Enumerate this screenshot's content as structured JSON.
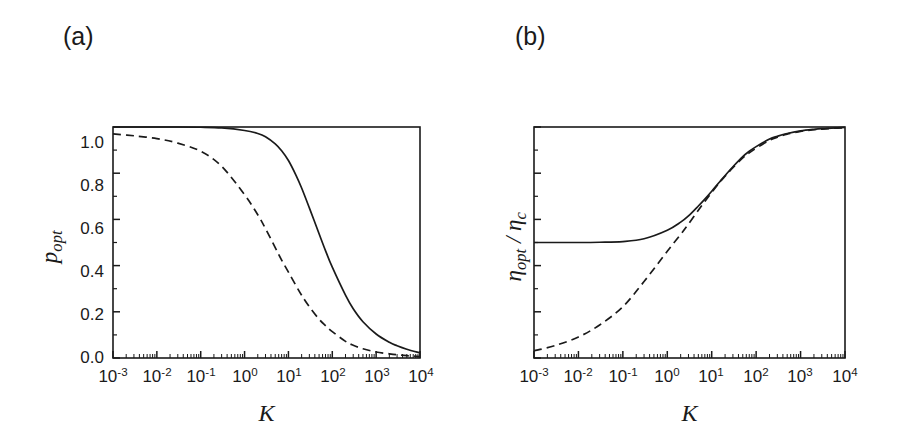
{
  "figure": {
    "background": "#ffffff",
    "line_color": "#1a1a1a"
  },
  "panels": [
    {
      "tag": "(a)",
      "ylabel_main": "p",
      "ylabel_sub": "opt",
      "xlabel": "K"
    },
    {
      "tag": "(b)",
      "ylabel_main": "η",
      "ylabel_sub": "opt",
      "ylabel_sep": " / ",
      "ylabel_main2": "η",
      "ylabel_sub2": "c",
      "xlabel": "K"
    }
  ],
  "axes": {
    "y_ticks": [
      "0.0",
      "0.2",
      "0.4",
      "0.6",
      "0.8",
      "1.0"
    ],
    "y_tick_values": [
      0.0,
      0.2,
      0.4,
      0.6,
      0.8,
      1.0
    ],
    "x_tick_mantissa": "10",
    "x_tick_exponents": [
      "-3",
      "-2",
      "-1",
      "0",
      "1",
      "2",
      "3",
      "4"
    ],
    "x_tick_values": [
      0.001,
      0.01,
      0.1,
      1,
      10,
      100,
      1000,
      10000
    ]
  },
  "chart_data": [
    {
      "type": "line",
      "title": "(a)",
      "xlabel": "K",
      "ylabel": "p_opt",
      "xscale": "log",
      "xlim": [
        0.001,
        10000
      ],
      "ylim": [
        0.0,
        1.0
      ],
      "grid": false,
      "legend": "none",
      "x": [
        0.001,
        0.003,
        0.01,
        0.03,
        0.1,
        0.3,
        1,
        2,
        3,
        5,
        7,
        10,
        15,
        20,
        30,
        50,
        70,
        100,
        200,
        300,
        500,
        1000,
        2000,
        3000,
        5000,
        10000
      ],
      "series": [
        {
          "name": "solid",
          "style": "solid",
          "values": [
            1.0,
            1.0,
            1.0,
            1.0,
            0.999,
            0.996,
            0.985,
            0.972,
            0.958,
            0.927,
            0.897,
            0.855,
            0.79,
            0.736,
            0.65,
            0.538,
            0.465,
            0.393,
            0.272,
            0.213,
            0.157,
            0.104,
            0.068,
            0.053,
            0.038,
            0.022
          ]
        },
        {
          "name": "dashed",
          "style": "dashed",
          "values": [
            0.97,
            0.962,
            0.95,
            0.93,
            0.895,
            0.83,
            0.707,
            0.62,
            0.56,
            0.478,
            0.424,
            0.372,
            0.312,
            0.272,
            0.222,
            0.168,
            0.14,
            0.114,
            0.072,
            0.055,
            0.04,
            0.026,
            0.018,
            0.014,
            0.01,
            0.006
          ]
        }
      ]
    },
    {
      "type": "line",
      "title": "(b)",
      "xlabel": "K",
      "ylabel": "eta_opt / eta_c",
      "xscale": "log",
      "xlim": [
        0.001,
        10000
      ],
      "ylim": [
        0.0,
        1.0
      ],
      "grid": false,
      "legend": "none",
      "x": [
        0.001,
        0.003,
        0.01,
        0.03,
        0.1,
        0.3,
        1,
        2,
        3,
        5,
        7,
        10,
        15,
        20,
        30,
        50,
        70,
        100,
        200,
        300,
        500,
        1000,
        2000,
        3000,
        5000,
        10000
      ],
      "series": [
        {
          "name": "solid",
          "style": "solid",
          "values": [
            0.5,
            0.5,
            0.5,
            0.501,
            0.504,
            0.516,
            0.553,
            0.588,
            0.615,
            0.658,
            0.688,
            0.722,
            0.762,
            0.79,
            0.828,
            0.872,
            0.895,
            0.915,
            0.948,
            0.96,
            0.972,
            0.983,
            0.99,
            0.993,
            0.995,
            0.998
          ]
        },
        {
          "name": "dashed",
          "style": "dashed",
          "values": [
            0.031,
            0.054,
            0.091,
            0.143,
            0.222,
            0.331,
            0.462,
            0.535,
            0.58,
            0.64,
            0.678,
            0.717,
            0.76,
            0.787,
            0.824,
            0.866,
            0.888,
            0.908,
            0.942,
            0.956,
            0.969,
            0.981,
            0.988,
            0.991,
            0.994,
            0.997
          ]
        }
      ]
    }
  ]
}
